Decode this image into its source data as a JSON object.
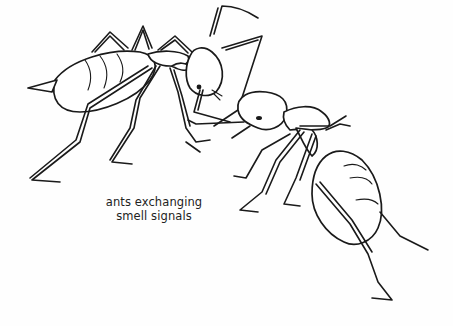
{
  "illustration": {
    "subject": "two ants touching antennae",
    "icons": [
      "ant-left-icon",
      "ant-right-icon"
    ],
    "colors": {
      "line": "#1a1a1a",
      "background": "#fefefe"
    }
  },
  "caption": {
    "line1": "ants exchanging",
    "line2": "smell signals"
  }
}
